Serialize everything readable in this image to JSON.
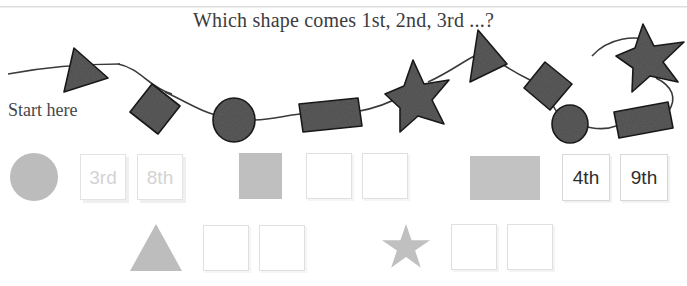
{
  "page": {
    "title": "Which shape comes 1st, 2nd, 3rd ...?",
    "start_label": "Start here"
  },
  "colors": {
    "chain_shape_fill": "#5d5d5d",
    "chain_shape_stroke": "#1c1c1c",
    "thread": "#3a3a3a",
    "swatch_gray": "#bfbfbf",
    "faint_text": "#d3d3d3",
    "dark_text": "#2e2e2e",
    "title_text": "#3b3b40"
  },
  "necklace": {
    "description": "Beaded string of shapes threaded on a curving line",
    "shapes": [
      {
        "index": 1,
        "type": "triangle"
      },
      {
        "index": 2,
        "type": "diamond"
      },
      {
        "index": 3,
        "type": "circle"
      },
      {
        "index": 4,
        "type": "rectangle"
      },
      {
        "index": 5,
        "type": "star"
      },
      {
        "index": 6,
        "type": "triangle"
      },
      {
        "index": 7,
        "type": "diamond"
      },
      {
        "index": 8,
        "type": "circle"
      },
      {
        "index": 9,
        "type": "rectangle"
      },
      {
        "index": 10,
        "type": "star"
      }
    ]
  },
  "answer_rows": [
    {
      "row": 1,
      "groups": [
        {
          "shape": "circle",
          "boxes": [
            {
              "value": "3rd",
              "state": "faint"
            },
            {
              "value": "8th",
              "state": "faint"
            }
          ]
        },
        {
          "shape": "square",
          "boxes": [
            {
              "value": "",
              "state": "empty"
            },
            {
              "value": "",
              "state": "empty"
            }
          ]
        },
        {
          "shape": "rectangle",
          "boxes": [
            {
              "value": "4th",
              "state": "dark"
            },
            {
              "value": "9th",
              "state": "dark"
            }
          ]
        }
      ]
    },
    {
      "row": 2,
      "groups": [
        {
          "shape": "triangle",
          "boxes": [
            {
              "value": "",
              "state": "empty"
            },
            {
              "value": "",
              "state": "empty"
            }
          ]
        },
        {
          "shape": "star",
          "boxes": [
            {
              "value": "",
              "state": "empty"
            },
            {
              "value": "",
              "state": "empty"
            }
          ]
        }
      ]
    }
  ]
}
